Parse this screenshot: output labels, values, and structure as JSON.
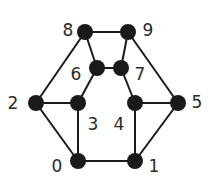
{
  "graph": {
    "nodes": [
      {
        "id": "0",
        "label": "0",
        "x": 78,
        "y": 161,
        "lx": 57,
        "ly": 167,
        "anchor": "middle"
      },
      {
        "id": "1",
        "label": "1",
        "x": 135,
        "y": 161,
        "lx": 154,
        "ly": 167,
        "anchor": "middle"
      },
      {
        "id": "2",
        "label": "2",
        "x": 36,
        "y": 103,
        "lx": 13,
        "ly": 104,
        "anchor": "middle"
      },
      {
        "id": "3",
        "label": "3",
        "x": 78,
        "y": 103,
        "lx": 93,
        "ly": 125,
        "anchor": "middle"
      },
      {
        "id": "4",
        "label": "4",
        "x": 135,
        "y": 103,
        "lx": 119,
        "ly": 125,
        "anchor": "middle"
      },
      {
        "id": "5",
        "label": "5",
        "x": 178,
        "y": 103,
        "lx": 197,
        "ly": 103,
        "anchor": "middle"
      },
      {
        "id": "6",
        "label": "6",
        "x": 97,
        "y": 68,
        "lx": 76,
        "ly": 75,
        "anchor": "middle"
      },
      {
        "id": "7",
        "label": "7",
        "x": 121,
        "y": 68,
        "lx": 140,
        "ly": 75,
        "anchor": "middle"
      },
      {
        "id": "8",
        "label": "8",
        "x": 85,
        "y": 32,
        "lx": 68,
        "ly": 31,
        "anchor": "middle"
      },
      {
        "id": "9",
        "label": "9",
        "x": 128,
        "y": 32,
        "lx": 148,
        "ly": 31,
        "anchor": "middle"
      }
    ],
    "edges": [
      [
        "8",
        "9"
      ],
      [
        "8",
        "6"
      ],
      [
        "9",
        "7"
      ],
      [
        "6",
        "7"
      ],
      [
        "6",
        "3"
      ],
      [
        "7",
        "4"
      ],
      [
        "8",
        "2"
      ],
      [
        "9",
        "5"
      ],
      [
        "2",
        "3"
      ],
      [
        "4",
        "5"
      ],
      [
        "2",
        "0"
      ],
      [
        "5",
        "1"
      ],
      [
        "3",
        "0"
      ],
      [
        "4",
        "1"
      ],
      [
        "0",
        "1"
      ]
    ],
    "node_radius": 8
  }
}
